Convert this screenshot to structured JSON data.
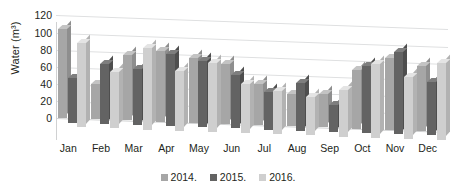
{
  "chart_data": {
    "type": "bar",
    "title": "",
    "xlabel": "",
    "ylabel": "Water (m³)",
    "ylim": [
      0,
      120
    ],
    "yticks": [
      0,
      20,
      40,
      60,
      80,
      100,
      120
    ],
    "grid": true,
    "legend_position": "bottom",
    "style": "3d-clustered-column",
    "categories": [
      "Jan",
      "Feb",
      "Mar",
      "Apr",
      "May",
      "Jun",
      "Jul",
      "Aug",
      "Sep",
      "Oct",
      "Nov",
      "Dec"
    ],
    "series": [
      {
        "name": "2014.",
        "color": "#a6a6a6",
        "values": [
          104,
          41,
          76,
          82,
          76,
          70,
          48,
          38,
          39,
          68,
          84,
          76
        ]
      },
      {
        "name": "2015.",
        "color": "#636363",
        "values": [
          52,
          70,
          65,
          84,
          78,
          62,
          44,
          56,
          32,
          78,
          96,
          62
        ]
      },
      {
        "name": "2016.",
        "color": "#cfcfcf",
        "values": [
          99,
          66,
          95,
          70,
          81,
          57,
          50,
          45,
          54,
          86,
          72,
          90
        ]
      }
    ]
  },
  "legend": {
    "items": [
      {
        "label": "2014.",
        "color": "#a6a6a6"
      },
      {
        "label": "2015.",
        "color": "#636363"
      },
      {
        "label": "2016.",
        "color": "#cfcfcf"
      }
    ]
  },
  "colors": {
    "gridline": "#dfe0e1",
    "text": "#231f20",
    "background": "#ffffff"
  }
}
